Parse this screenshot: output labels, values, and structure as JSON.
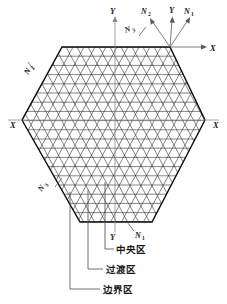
{
  "figure": {
    "shape": "hexagon",
    "mesh_type": "triangular",
    "colors": {
      "mesh_line": "#1f1f1f",
      "hex_outline": "#0d0d0d",
      "axis": "#8a8a8a",
      "normal_arrow": "#5a5a5a",
      "leader": "#4a4a4a",
      "text": "#1a1a1a",
      "background": "#ffffff"
    }
  },
  "axes": {
    "y_top": {
      "base": "Y",
      "label": "Y"
    },
    "y_bottom": {
      "base": "Y",
      "label": "Y"
    },
    "x_right_arrow": {
      "base": "X",
      "label": "X"
    },
    "x_left": {
      "base": "X",
      "label": "X"
    },
    "x_right": {
      "base": "X",
      "label": "X"
    }
  },
  "normals": [
    {
      "id": "n1-top-right",
      "base": "N",
      "sub": "1",
      "label": "N1"
    },
    {
      "id": "n2-top-right",
      "base": "N",
      "sub": "2",
      "label": "N2"
    },
    {
      "id": "n3-top-edge",
      "base": "N",
      "sub": "3",
      "label": "N3"
    },
    {
      "id": "n2-upper-left",
      "base": "N",
      "sub": "2",
      "label": "N2"
    },
    {
      "id": "n3-lower-left",
      "base": "N",
      "sub": "3",
      "label": "N3"
    },
    {
      "id": "n1-bottom",
      "base": "N",
      "sub": "1",
      "label": "N1"
    }
  ],
  "zones": [
    {
      "id": "central",
      "label": "中央区"
    },
    {
      "id": "transition",
      "label": "过渡区"
    },
    {
      "id": "boundary",
      "label": "边界区"
    }
  ]
}
